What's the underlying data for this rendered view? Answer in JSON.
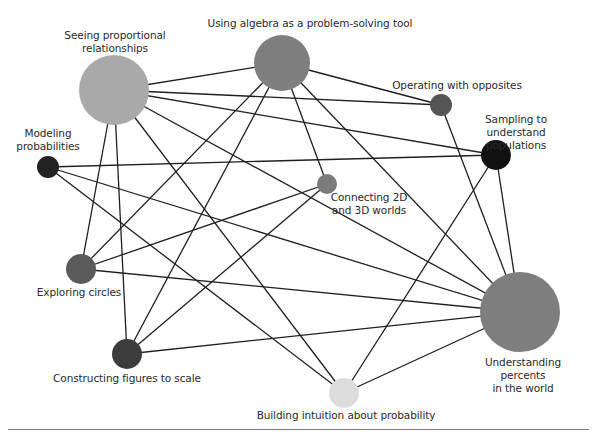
{
  "diagram": {
    "type": "network",
    "nodes": [
      {
        "id": "SP",
        "label": "Seeing proportional\nrelationships",
        "x": 114,
        "y": 90,
        "r": 35,
        "color": "#a9a9a9",
        "label_x": 115,
        "label_y": 29
      },
      {
        "id": "UA",
        "label": "Using algebra as a problem-solving tool",
        "x": 282,
        "y": 63,
        "r": 28,
        "color": "#7f7f7f",
        "label_x": 310,
        "label_y": 17
      },
      {
        "id": "OO",
        "label": "Operating with opposites",
        "x": 441,
        "y": 105,
        "r": 11,
        "color": "#555555",
        "label_x": 457,
        "label_y": 79
      },
      {
        "id": "SA",
        "label": "Sampling to understand\npopulations",
        "x": 496,
        "y": 155,
        "r": 15,
        "color": "#111111",
        "label_x": 516,
        "label_y": 113
      },
      {
        "id": "MP",
        "label": "Modeling\nprobabilities",
        "x": 48,
        "y": 167,
        "r": 11,
        "color": "#222222",
        "label_x": 48,
        "label_y": 127
      },
      {
        "id": "C2",
        "label": "Connecting 2D\nand 3D worlds",
        "x": 327,
        "y": 184,
        "r": 10,
        "color": "#7a7a7a",
        "label_x": 369,
        "label_y": 191
      },
      {
        "id": "EC",
        "label": "Exploring circles",
        "x": 81,
        "y": 269,
        "r": 15,
        "color": "#5a5a5a",
        "label_x": 79,
        "label_y": 286
      },
      {
        "id": "CF",
        "label": "Constructing figures to scale",
        "x": 127,
        "y": 354,
        "r": 15,
        "color": "#3c3c3c",
        "label_x": 127,
        "label_y": 372
      },
      {
        "id": "UP",
        "label": "Understanding percents\nin the world",
        "x": 520,
        "y": 312,
        "r": 40,
        "color": "#7e7e7e",
        "label_x": 523,
        "label_y": 356
      },
      {
        "id": "BI",
        "label": "Building intuition about probability",
        "x": 344,
        "y": 393,
        "r": 15,
        "color": "#dcdcdc",
        "label_x": 346,
        "label_y": 409
      }
    ],
    "edges": [
      [
        "SP",
        "UA"
      ],
      [
        "SP",
        "OO"
      ],
      [
        "SP",
        "SA"
      ],
      [
        "SP",
        "UP"
      ],
      [
        "SP",
        "EC"
      ],
      [
        "SP",
        "CF"
      ],
      [
        "SP",
        "BI"
      ],
      [
        "UA",
        "OO"
      ],
      [
        "UA",
        "EC"
      ],
      [
        "UA",
        "CF"
      ],
      [
        "UA",
        "C2"
      ],
      [
        "UA",
        "UP"
      ],
      [
        "OO",
        "UP"
      ],
      [
        "SA",
        "MP"
      ],
      [
        "SA",
        "BI"
      ],
      [
        "SA",
        "UP"
      ],
      [
        "MP",
        "UP"
      ],
      [
        "MP",
        "BI"
      ],
      [
        "C2",
        "EC"
      ],
      [
        "C2",
        "CF"
      ],
      [
        "EC",
        "UP"
      ],
      [
        "CF",
        "UP"
      ],
      [
        "BI",
        "UP"
      ]
    ],
    "edge_color": "#1f1f1f"
  }
}
